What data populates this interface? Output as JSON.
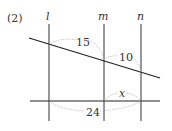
{
  "problem_number": "(2)",
  "lines": {
    "parallel": [
      {
        "name": "l",
        "x": 49
      },
      {
        "name": "m",
        "x": 104
      },
      {
        "name": "n",
        "x": 141
      }
    ],
    "transversal_top": {
      "x1": 29,
      "y1": 38,
      "x2": 160,
      "y2": 78
    },
    "transversal_bottom": {
      "x1": 30,
      "y1": 101,
      "x2": 160,
      "y2": 101
    }
  },
  "segment_labels": {
    "top_l_m": "15",
    "top_m_n": "10",
    "bottom_m_n": "x",
    "bottom_l_n": "24"
  },
  "colors": {
    "line": "#222222",
    "dotted_arc": "#999999",
    "text": "#333333"
  }
}
